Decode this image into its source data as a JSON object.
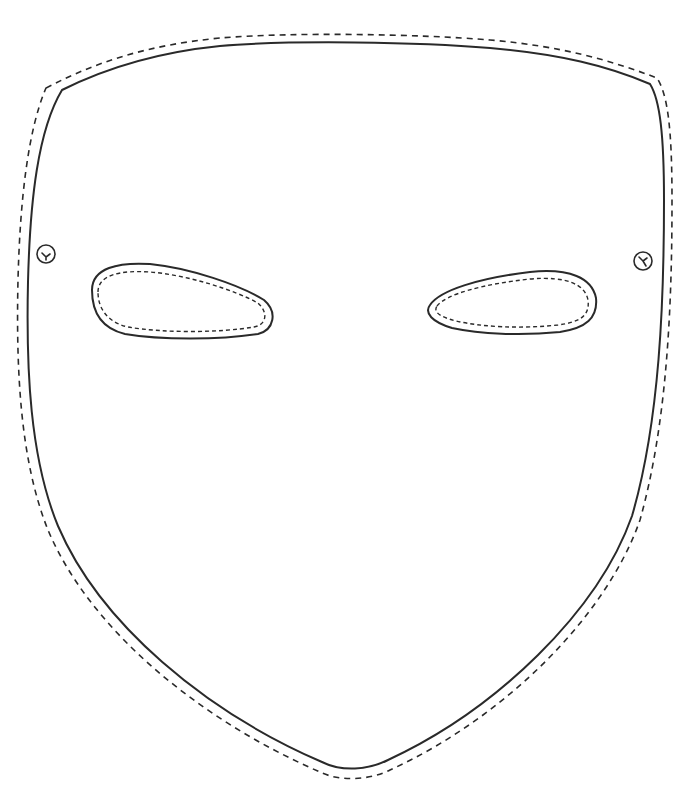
{
  "template": {
    "subject": "blank face mask template",
    "line_color": "#2a2a2a",
    "background": "#ffffff"
  },
  "parts": {
    "outer_dashed_outline": "dashed",
    "mask_outline": "solid",
    "left_eye": {
      "outline": "solid",
      "inner": "dashed"
    },
    "right_eye": {
      "outline": "solid",
      "inner": "dashed"
    },
    "left_string_hole": {
      "mark": "Y"
    },
    "right_string_hole": {
      "mark": "Y"
    }
  }
}
